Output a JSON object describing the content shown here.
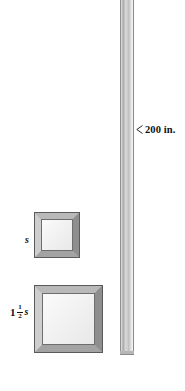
{
  "figure": {
    "type": "geometry-diagram",
    "background_color": "#ffffff"
  },
  "pole": {
    "name": "molding-pole",
    "orientation": "vertical",
    "color_light": "#f2f2f2",
    "color_mid": "#bfbfbf",
    "color_dark": "#8f8f8f"
  },
  "measurement": {
    "arrow_icon": "left-pointer-arrow-icon",
    "label": "200 in.",
    "value": 200,
    "unit": "in.",
    "points_to": "molding-pole"
  },
  "frames": [
    {
      "id": "small",
      "name": "square-frame-small",
      "label": "s",
      "label_parts": {
        "whole": "",
        "numerator": "",
        "denominator": "",
        "variable": "s"
      },
      "side_length_expression": "s",
      "frame_color": "#8c8c8c",
      "border_color": "#5a5a5a",
      "fill_color": "#f2f2f2"
    },
    {
      "id": "large",
      "name": "square-frame-large",
      "label": "1 1/2 s",
      "label_parts": {
        "whole": "1",
        "numerator": "1",
        "denominator": "2",
        "variable": "s"
      },
      "side_length_expression": "1 1/2 s",
      "frame_color": "#8c8c8c",
      "border_color": "#5a5a5a",
      "fill_color": "#f2f2f2"
    }
  ]
}
